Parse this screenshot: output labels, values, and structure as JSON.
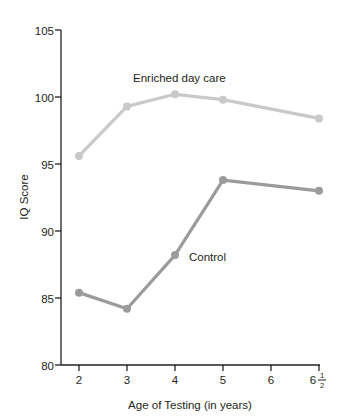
{
  "chart_data": {
    "type": "line",
    "title": "",
    "xlabel": "Age of Testing (in years)",
    "ylabel": "IQ Score",
    "x": [
      2,
      3,
      4,
      5,
      6.5
    ],
    "xtick_labels": [
      "2",
      "3",
      "4",
      "5",
      "6",
      "6½"
    ],
    "xtick_positions": [
      2,
      3,
      4,
      5,
      6,
      6.5
    ],
    "xlim": [
      1.6,
      6.5
    ],
    "ylim": [
      80,
      105
    ],
    "ytick_labels": [
      "80",
      "85",
      "90",
      "95",
      "100",
      "105"
    ],
    "ytick_values": [
      80,
      85,
      90,
      95,
      100,
      105
    ],
    "grid": false,
    "legend": "inline-labels",
    "series": [
      {
        "name": "Enriched day care",
        "color": "#c9c9c9",
        "label_x": 4.0,
        "label_y": 101.6,
        "values": [
          95.6,
          99.3,
          100.2,
          99.8,
          98.4
        ]
      },
      {
        "name": "Control",
        "color": "#9b9b9b",
        "label_x": 4.2,
        "label_y": 88.3,
        "values": [
          85.4,
          84.2,
          88.2,
          93.8,
          93.0
        ]
      }
    ]
  },
  "axis": {
    "ylabel": "IQ Score",
    "xlabel": "Age of Testing (in years)",
    "ytick_0": "80",
    "ytick_1": "85",
    "ytick_2": "90",
    "ytick_3": "95",
    "ytick_4": "100",
    "ytick_5": "105",
    "xtick_0": "2",
    "xtick_1": "3",
    "xtick_2": "4",
    "xtick_3": "5",
    "xtick_4": "6",
    "xtick_5_whole": "6",
    "xtick_5_num": "1",
    "xtick_5_den": "2",
    "axis_color": "#231f20"
  },
  "series_labels": {
    "enriched": "Enriched day care",
    "control": "Control"
  }
}
